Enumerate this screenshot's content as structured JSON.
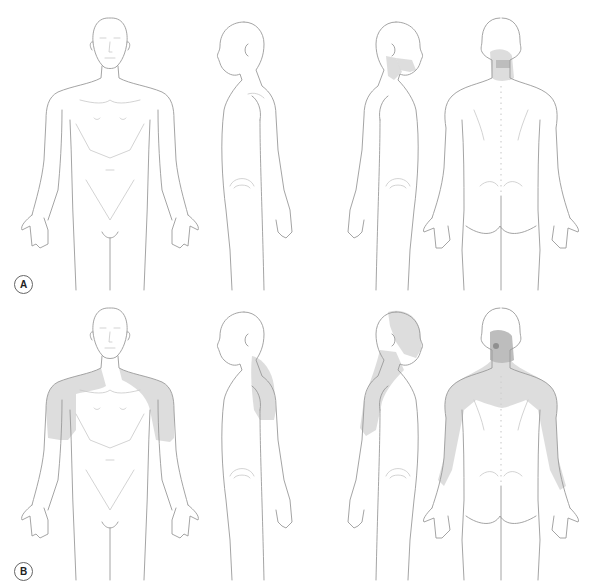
{
  "figure": {
    "type": "body-chart pain referral diagram",
    "views": [
      "anterior",
      "right-lateral",
      "left-lateral",
      "posterior"
    ],
    "colors": {
      "outline": "#9a9a9a",
      "detail": "#c8c8c8",
      "shade_light": "#d9d9d9",
      "shade_mid": "#bdbdbd",
      "shade_dark": "#8f8f8f",
      "background": "#ffffff"
    }
  },
  "panels": [
    {
      "label": "A",
      "figures": [
        {
          "view": "anterior",
          "shaded_regions": []
        },
        {
          "view": "right-lateral",
          "shaded_regions": []
        },
        {
          "view": "left-lateral",
          "shaded_regions": [
            "lateral neck",
            "jaw angle"
          ]
        },
        {
          "view": "posterior",
          "shaded_regions": [
            "upper cervical / suboccipital (dark center)",
            "posterior neck"
          ]
        }
      ]
    },
    {
      "label": "B",
      "figures": [
        {
          "view": "anterior",
          "shaded_regions": [
            "both shoulders",
            "upper arms",
            "upper chest/trapezius"
          ]
        },
        {
          "view": "right-lateral",
          "shaded_regions": [
            "shoulder",
            "upper arm"
          ]
        },
        {
          "view": "left-lateral",
          "shaded_regions": [
            "head/face side",
            "neck",
            "shoulder",
            "upper arm"
          ]
        },
        {
          "view": "posterior",
          "shaded_regions": [
            "cervical spot (dark)",
            "neck and upper back",
            "scapular region",
            "both arms",
            "forearm ulnar side"
          ]
        }
      ]
    }
  ]
}
